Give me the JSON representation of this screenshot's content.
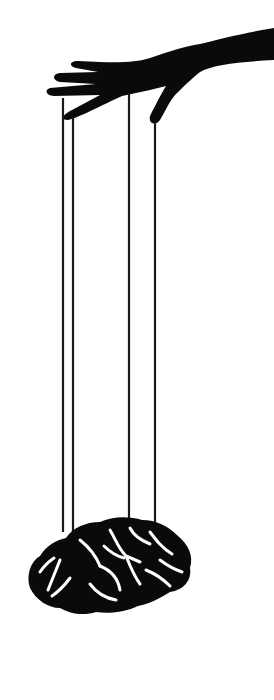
{
  "image": {
    "description": "Silhouette illustration of a hand controlling a brain like a marionette via four strings",
    "colors": {
      "background": "#ffffff",
      "ink": "#0a0a0a"
    },
    "elements": [
      "hand-silhouette",
      "puppet-strings",
      "brain-silhouette"
    ]
  }
}
